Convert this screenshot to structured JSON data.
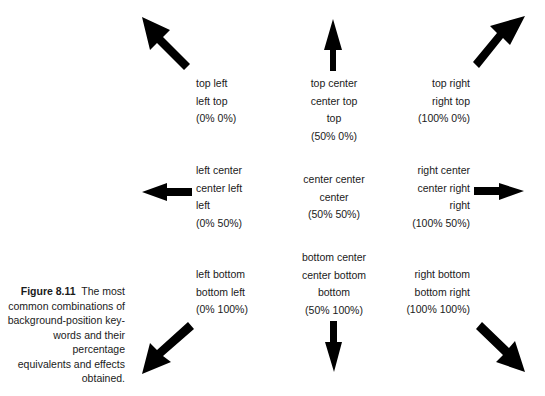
{
  "caption": {
    "figure_label": "Figure 8.11",
    "text_lines": [
      "The most",
      "common combinations of",
      "background-position key-",
      "words and their percentage",
      "equivalents and effects",
      "obtained."
    ]
  },
  "positions": {
    "top_left": [
      "top left",
      "left top",
      "(0% 0%)"
    ],
    "top_center": [
      "top center",
      "center top",
      "top",
      "(50% 0%)"
    ],
    "top_right": [
      "top right",
      "right top",
      "(100% 0%)"
    ],
    "center_left": [
      "left center",
      "center left",
      "left",
      "(0% 50%)"
    ],
    "center_center": [
      "center center",
      "center",
      "(50% 50%)"
    ],
    "center_right": [
      "right center",
      "center right",
      "right",
      "(100% 50%)"
    ],
    "bottom_left": [
      "left bottom",
      "bottom left",
      "(0% 100%)"
    ],
    "bottom_center": [
      "bottom center",
      "center bottom",
      "bottom",
      "(50% 100%)"
    ],
    "bottom_right": [
      "right bottom",
      "bottom right",
      "(100% 100%)"
    ]
  },
  "arrows": {
    "color": "#000000",
    "directions": [
      "up-left",
      "up",
      "up-right",
      "left",
      "right",
      "down-left",
      "down",
      "down-right"
    ]
  }
}
